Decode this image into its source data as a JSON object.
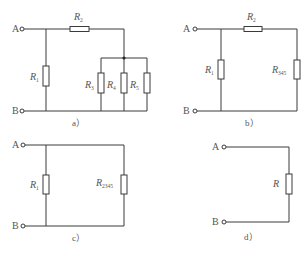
{
  "figure": {
    "panels": [
      {
        "id": "a",
        "caption": "a）",
        "terminals": {
          "top": "A",
          "bottom": "B"
        },
        "resistors": [
          {
            "name": "R",
            "sub": "1"
          },
          {
            "name": "R",
            "sub": "2"
          },
          {
            "name": "R",
            "sub": "3"
          },
          {
            "name": "R",
            "sub": "4"
          },
          {
            "name": "R",
            "sub": "5"
          }
        ]
      },
      {
        "id": "b",
        "caption": "b）",
        "terminals": {
          "top": "A",
          "bottom": "B"
        },
        "resistors": [
          {
            "name": "R",
            "sub": "1"
          },
          {
            "name": "R",
            "sub": "2"
          },
          {
            "name": "R",
            "sub": "345"
          }
        ]
      },
      {
        "id": "c",
        "caption": "c）",
        "terminals": {
          "top": "A",
          "bottom": "B"
        },
        "resistors": [
          {
            "name": "R",
            "sub": "1"
          },
          {
            "name": "R",
            "sub": "2345"
          }
        ]
      },
      {
        "id": "d",
        "caption": "d）",
        "terminals": {
          "top": "A",
          "bottom": "B"
        },
        "resistors": [
          {
            "name": "R",
            "sub": ""
          }
        ]
      }
    ]
  }
}
